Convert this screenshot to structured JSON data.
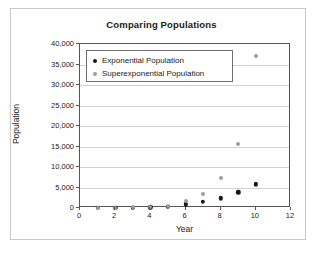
{
  "chart_data": {
    "type": "scatter",
    "title": "Comparing Populations",
    "xlabel": "Year",
    "ylabel": "Population",
    "xlim": [
      0,
      12
    ],
    "ylim": [
      0,
      40000
    ],
    "xticks": [
      "0",
      "2",
      "4",
      "6",
      "8",
      "10",
      "12"
    ],
    "xtick_values": [
      0,
      2,
      4,
      6,
      8,
      10,
      12
    ],
    "yticks": [
      "0",
      "5,000",
      "10,000",
      "15,000",
      "20,000",
      "25,000",
      "30,000",
      "35,000",
      "40,000"
    ],
    "ytick_values": [
      0,
      5000,
      10000,
      15000,
      20000,
      25000,
      30000,
      35000,
      40000
    ],
    "grid": true,
    "legend_position": "upper left",
    "x": [
      1,
      2,
      3,
      4,
      5,
      6,
      7,
      8,
      9,
      10
    ],
    "series": [
      {
        "name": "Exponential Population",
        "color": "#171717",
        "marker": "circle",
        "values": [
          20,
          40,
          80,
          160,
          320,
          900,
          1500,
          2400,
          3800,
          5800
        ]
      },
      {
        "name": "Superexponential Population",
        "color": "#9d9d9d",
        "marker": "circle",
        "values": [
          20,
          60,
          130,
          280,
          600,
          1600,
          3400,
          7200,
          15500,
          37000
        ]
      }
    ]
  },
  "legend": {
    "entries": [
      {
        "label": "Exponential Population"
      },
      {
        "label": "Superexponential Population"
      }
    ]
  },
  "colors": {
    "exponential": "#171717",
    "superexponential": "#9d9d9d",
    "axis": "#555555",
    "grid": "#d2d2d2",
    "frame": "#c9c9c9"
  }
}
